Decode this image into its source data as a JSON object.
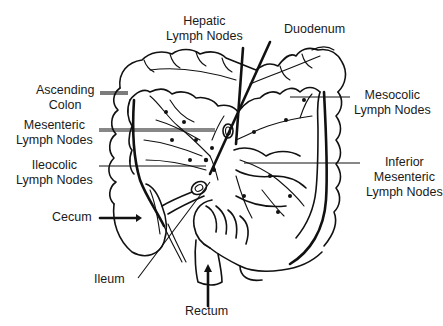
{
  "figure": {
    "type": "anatomical line drawing",
    "colors": {
      "ink": "#111111",
      "background": "#ffffff"
    }
  },
  "labels": {
    "hepatic": [
      "Hepatic",
      "Lymph Nodes"
    ],
    "duodenum": [
      "Duodenum"
    ],
    "ascending_colon": [
      "Ascending",
      "Colon"
    ],
    "mesenteric": [
      "Mesenteric",
      "Lymph Nodes"
    ],
    "ileocolic": [
      "Ileocolic",
      "Lymph Nodes"
    ],
    "cecum": [
      "Cecum"
    ],
    "ileum": [
      "Ileum"
    ],
    "rectum": [
      "Rectum"
    ],
    "mesocolic": [
      "Mesocolic",
      "Lymph Nodes"
    ],
    "inferior_mesenteric": [
      "Inferior",
      "Mesenteric",
      "Lymph Nodes"
    ]
  }
}
